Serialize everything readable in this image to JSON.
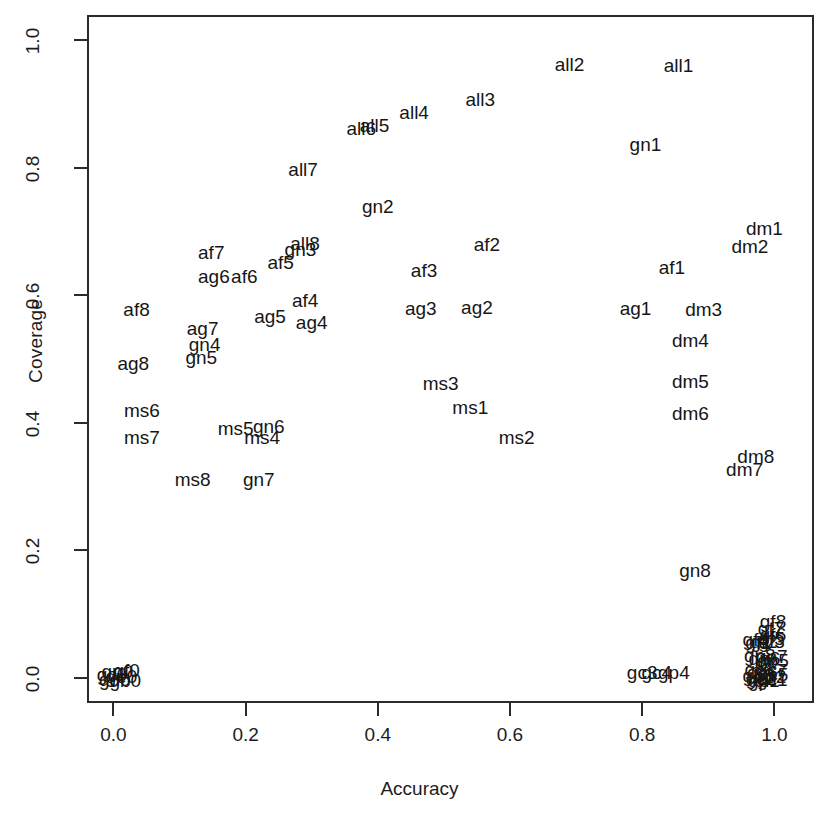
{
  "chart_data": {
    "type": "scatter",
    "title": "",
    "xlabel": "Accuracy",
    "ylabel": "Coverage",
    "xlim": [
      -0.04,
      1.06
    ],
    "ylim": [
      -0.04,
      1.04
    ],
    "xticks": [
      "0.0",
      "0.2",
      "0.4",
      "0.6",
      "0.8",
      "1.0"
    ],
    "xtickvals": [
      0.0,
      0.2,
      0.4,
      0.6,
      0.8,
      1.0
    ],
    "yticks": [
      "0.0",
      "0.2",
      "0.4",
      "0.6",
      "0.8",
      "1.0"
    ],
    "ytickvals": [
      0.0,
      0.2,
      0.4,
      0.6,
      0.8,
      1.0
    ],
    "grid": false,
    "legend": "none",
    "marker_style": "text-label",
    "points": [
      {
        "label": "all1",
        "x": 0.855,
        "y": 0.962
      },
      {
        "label": "all2",
        "x": 0.69,
        "y": 0.963
      },
      {
        "label": "all3",
        "x": 0.555,
        "y": 0.908
      },
      {
        "label": "all4",
        "x": 0.455,
        "y": 0.888
      },
      {
        "label": "all5",
        "x": 0.395,
        "y": 0.868
      },
      {
        "label": "all6",
        "x": 0.375,
        "y": 0.862
      },
      {
        "label": "all7",
        "x": 0.287,
        "y": 0.798
      },
      {
        "label": "all8",
        "x": 0.29,
        "y": 0.682
      },
      {
        "label": "gn1",
        "x": 0.805,
        "y": 0.838
      },
      {
        "label": "gn2",
        "x": 0.4,
        "y": 0.74
      },
      {
        "label": "gn3",
        "x": 0.283,
        "y": 0.673
      },
      {
        "label": "gn4",
        "x": 0.138,
        "y": 0.523
      },
      {
        "label": "gn5",
        "x": 0.133,
        "y": 0.503
      },
      {
        "label": "gn6",
        "x": 0.235,
        "y": 0.395
      },
      {
        "label": "gn7",
        "x": 0.22,
        "y": 0.312
      },
      {
        "label": "gn8",
        "x": 0.88,
        "y": 0.168
      },
      {
        "label": "af1",
        "x": 0.845,
        "y": 0.645
      },
      {
        "label": "af2",
        "x": 0.565,
        "y": 0.68
      },
      {
        "label": "af3",
        "x": 0.47,
        "y": 0.64
      },
      {
        "label": "af4",
        "x": 0.29,
        "y": 0.592
      },
      {
        "label": "af5",
        "x": 0.253,
        "y": 0.652
      },
      {
        "label": "af6",
        "x": 0.198,
        "y": 0.63
      },
      {
        "label": "af7",
        "x": 0.148,
        "y": 0.668
      },
      {
        "label": "af8",
        "x": 0.035,
        "y": 0.578
      },
      {
        "label": "ag1",
        "x": 0.79,
        "y": 0.58
      },
      {
        "label": "ag2",
        "x": 0.55,
        "y": 0.582
      },
      {
        "label": "ag3",
        "x": 0.465,
        "y": 0.58
      },
      {
        "label": "ag4",
        "x": 0.3,
        "y": 0.558
      },
      {
        "label": "ag5",
        "x": 0.237,
        "y": 0.568
      },
      {
        "label": "ag6",
        "x": 0.152,
        "y": 0.63
      },
      {
        "label": "ag7",
        "x": 0.135,
        "y": 0.548
      },
      {
        "label": "ag8",
        "x": 0.03,
        "y": 0.493
      },
      {
        "label": "ms1",
        "x": 0.54,
        "y": 0.425
      },
      {
        "label": "ms2",
        "x": 0.61,
        "y": 0.378
      },
      {
        "label": "ms3",
        "x": 0.495,
        "y": 0.463
      },
      {
        "label": "ms4",
        "x": 0.225,
        "y": 0.378
      },
      {
        "label": "ms5",
        "x": 0.185,
        "y": 0.392
      },
      {
        "label": "ms6",
        "x": 0.043,
        "y": 0.42
      },
      {
        "label": "ms7",
        "x": 0.043,
        "y": 0.378
      },
      {
        "label": "ms8",
        "x": 0.12,
        "y": 0.312
      },
      {
        "label": "dm1",
        "x": 0.985,
        "y": 0.705
      },
      {
        "label": "dm2",
        "x": 0.963,
        "y": 0.678
      },
      {
        "label": "dm3",
        "x": 0.893,
        "y": 0.578
      },
      {
        "label": "dm4",
        "x": 0.873,
        "y": 0.53
      },
      {
        "label": "dm5",
        "x": 0.873,
        "y": 0.465
      },
      {
        "label": "dm6",
        "x": 0.873,
        "y": 0.415
      },
      {
        "label": "dm7",
        "x": 0.955,
        "y": 0.328
      },
      {
        "label": "dm8",
        "x": 0.972,
        "y": 0.348
      },
      {
        "label": "gc3",
        "x": 0.8,
        "y": 0.008
      },
      {
        "label": "gc4",
        "x": 0.822,
        "y": 0.008
      },
      {
        "label": "gp4",
        "x": 0.848,
        "y": 0.008
      },
      {
        "label": "gf8",
        "x": 0.998,
        "y": 0.088
      },
      {
        "label": "gf7",
        "x": 0.995,
        "y": 0.078
      },
      {
        "label": "gf6",
        "x": 0.998,
        "y": 0.068
      },
      {
        "label": "gf5",
        "x": 0.996,
        "y": 0.062
      },
      {
        "label": "gf4",
        "x": 0.972,
        "y": 0.06
      },
      {
        "label": "gf3",
        "x": 0.996,
        "y": 0.058
      },
      {
        "label": "gf2",
        "x": 0.984,
        "y": 0.058
      },
      {
        "label": "gf1",
        "x": 0.976,
        "y": 0.056
      },
      {
        "label": "gp8",
        "x": 0.978,
        "y": 0.036
      },
      {
        "label": "gp7",
        "x": 0.996,
        "y": 0.034
      },
      {
        "label": "gp6",
        "x": 0.985,
        "y": 0.03
      },
      {
        "label": "gp5",
        "x": 0.998,
        "y": 0.028
      },
      {
        "label": "gc8",
        "x": 0.978,
        "y": 0.014
      },
      {
        "label": "gc7",
        "x": 0.996,
        "y": 0.012
      },
      {
        "label": "gc6",
        "x": 0.982,
        "y": 0.008
      },
      {
        "label": "gc5",
        "x": 0.998,
        "y": 0.006
      },
      {
        "label": "gp3",
        "x": 0.976,
        "y": 0.004
      },
      {
        "label": "gp2",
        "x": 0.994,
        "y": 0.002
      },
      {
        "label": "gc2",
        "x": 0.98,
        "y": 0.0
      },
      {
        "label": "gc1",
        "x": 0.997,
        "y": -0.002
      },
      {
        "label": "gp1",
        "x": 0.984,
        "y": -0.004
      },
      {
        "label": "gf0",
        "x": 0.02,
        "y": 0.012
      },
      {
        "label": "gp0",
        "x": 0.006,
        "y": 0.01
      },
      {
        "label": "gc0",
        "x": -0.002,
        "y": 0.006
      },
      {
        "label": "ge0",
        "x": 0.012,
        "y": 0.002
      },
      {
        "label": "gd0",
        "x": 0.002,
        "y": -0.002
      },
      {
        "label": "gb0",
        "x": 0.018,
        "y": -0.004
      }
    ]
  }
}
